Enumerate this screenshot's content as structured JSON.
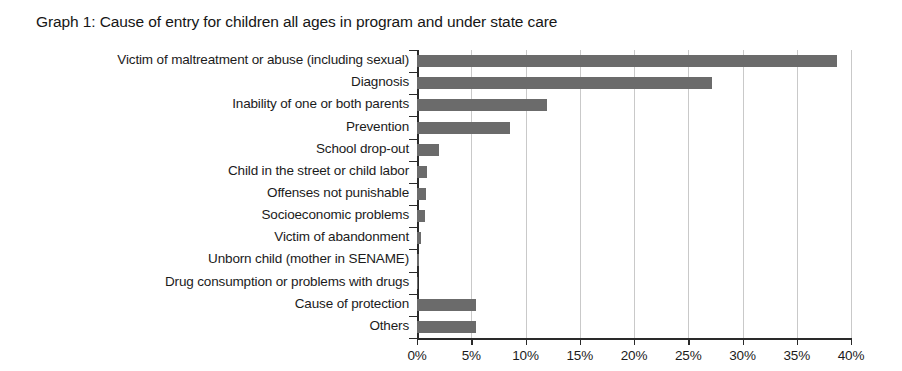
{
  "chart_data": {
    "type": "bar",
    "orientation": "horizontal",
    "title": "Graph 1: Cause of entry for children all ages in program and under state care",
    "xlabel": "",
    "ylabel": "",
    "xlim": [
      0,
      40
    ],
    "grid": true,
    "legend": null,
    "bar_color": "#6b6b6b",
    "axis_color": "#2a2a2a",
    "gridline_color": "#c9c9c9",
    "x_tick_labels": [
      "0%",
      "5%",
      "10%",
      "15%",
      "20%",
      "25%",
      "30%",
      "35%",
      "40%"
    ],
    "x_tick_values": [
      0,
      5,
      10,
      15,
      20,
      25,
      30,
      35,
      40
    ],
    "categories": [
      "Victim of maltreatment or abuse (including sexual)",
      "Diagnosis",
      "Inability of one or both parents",
      "Prevention",
      "School drop-out",
      "Child in the street or child labor",
      "Offenses not punishable",
      "Socioeconomic problems",
      "Victim of abandonment",
      "Unborn child (mother in SENAME)",
      "Drug consumption or problems with drugs",
      "Cause of protection",
      "Others"
    ],
    "values": [
      38.7,
      27.2,
      12.0,
      8.6,
      2.0,
      0.9,
      0.8,
      0.7,
      0.4,
      0.15,
      0.1,
      5.4,
      5.4
    ]
  }
}
